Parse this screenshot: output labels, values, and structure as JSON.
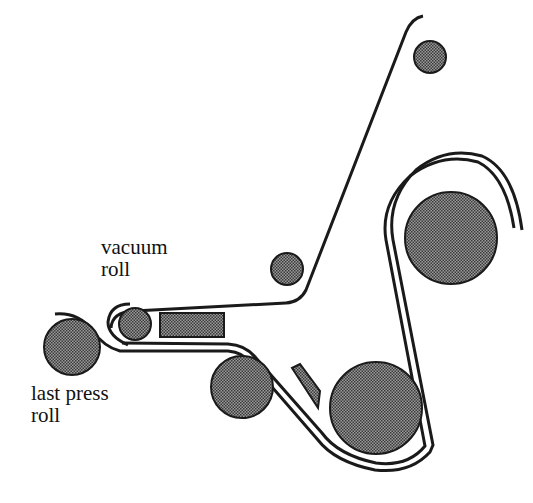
{
  "diagram": {
    "labels": {
      "vacuum_roll": [
        "vacuum",
        "roll"
      ],
      "last_press_roll": [
        "last press",
        "roll"
      ]
    },
    "colors": {
      "line": "#1a1a1a",
      "roll_fill": "#7a7a7a",
      "background": "#ffffff"
    },
    "components": [
      "last press roll",
      "vacuum roll",
      "suction box",
      "guide roll (small, upper middle)",
      "guide roll (small, top right)",
      "large dryer roll (upper right)",
      "large dryer roll (bottom)",
      "lower roll (left of doctor)",
      "doctor blade"
    ]
  }
}
